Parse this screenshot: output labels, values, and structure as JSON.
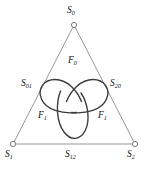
{
  "figure": {
    "type": "geometric-diagram",
    "colors": {
      "background": "#ffffff",
      "triangle_stroke": "#8a8a8a",
      "trefoil_stroke": "#3a3a3a",
      "vertex_marker_stroke": "#6f6f6f",
      "vertex_marker_fill": "#ffffff",
      "text": "#111111"
    },
    "vertices": [
      {
        "id": "S0",
        "base": "S",
        "sub": "0",
        "x": 74,
        "y": 25
      },
      {
        "id": "S1",
        "base": "S",
        "sub": "1",
        "x": 13,
        "y": 144
      },
      {
        "id": "S2",
        "base": "S",
        "sub": "2",
        "x": 135,
        "y": 144
      }
    ],
    "midpoints": [
      {
        "id": "S01",
        "base": "S",
        "sub": "01",
        "x": 43,
        "y": 85
      },
      {
        "id": "S12",
        "base": "S",
        "sub": "12",
        "x": 74,
        "y": 144
      },
      {
        "id": "S20",
        "base": "S",
        "sub": "20",
        "x": 105,
        "y": 85
      }
    ],
    "faces": [
      {
        "id": "F0-top",
        "base": "F",
        "sub": "0",
        "x": 74,
        "y": 62
      },
      {
        "id": "F1-left",
        "base": "F",
        "sub": "1",
        "x": 44,
        "y": 117
      },
      {
        "id": "F1-right",
        "base": "F",
        "sub": "1",
        "x": 104,
        "y": 117
      }
    ],
    "labels": {
      "vertex_top": {
        "base": "S",
        "sub": "0"
      },
      "vertex_bottom_left": {
        "base": "S",
        "sub": "1"
      },
      "vertex_bottom_right": {
        "base": "S",
        "sub": "2"
      },
      "edge_left": {
        "base": "S",
        "sub": "01"
      },
      "edge_bottom": {
        "base": "S",
        "sub": "12"
      },
      "edge_right": {
        "base": "S",
        "sub": "20"
      },
      "face_top": {
        "base": "F",
        "sub": "0"
      },
      "face_left": {
        "base": "F",
        "sub": "1"
      },
      "face_right": {
        "base": "F",
        "sub": "1"
      }
    }
  }
}
